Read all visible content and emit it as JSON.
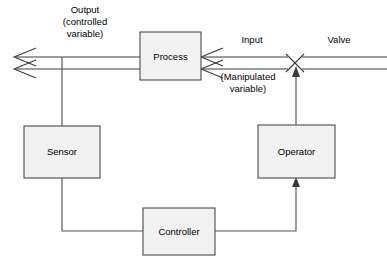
{
  "diagram": {
    "type": "block-flow-diagram",
    "colors": {
      "box_fill": "#f1f1f1",
      "box_border": "#4a4a4a",
      "line": "#3c3c3c",
      "signal_line": "#5a5a5a",
      "background": "#ffffff",
      "text": "#000000"
    },
    "blocks": [
      {
        "id": "process",
        "label": "Process",
        "x": 140,
        "y": 32,
        "w": 61,
        "h": 48
      },
      {
        "id": "sensor",
        "label": "Sensor",
        "x": 24,
        "y": 126,
        "w": 76,
        "h": 52
      },
      {
        "id": "operator",
        "label": "Operator",
        "x": 258,
        "y": 125,
        "w": 77,
        "h": 53
      },
      {
        "id": "controller",
        "label": "Controller",
        "x": 143,
        "y": 208,
        "w": 72,
        "h": 47
      }
    ],
    "annotations": [
      {
        "id": "output-label",
        "lines": [
          "Output",
          "(controlled",
          "variable)"
        ],
        "x": 85,
        "y": 13
      },
      {
        "id": "input-label",
        "lines": [
          "Input"
        ],
        "x": 252,
        "y": 43
      },
      {
        "id": "manipulated-label",
        "lines": [
          "(Manipulated",
          "variable)"
        ],
        "x": 248,
        "y": 80
      },
      {
        "id": "valve-label",
        "lines": [
          "Valve"
        ],
        "x": 339,
        "y": 43
      }
    ],
    "valve": {
      "id": "valve-symbol",
      "shape": "bowtie-cross",
      "center_x": 295,
      "center_y": 63
    },
    "flows": [
      {
        "id": "output-flow",
        "from": "process",
        "to": "output-arrow",
        "style": "double-line-pipe"
      },
      {
        "id": "input-flow",
        "from": "valve",
        "to": "process",
        "style": "double-line-pipe"
      },
      {
        "id": "supply-flow",
        "from": "right-edge",
        "to": "valve",
        "style": "double-line-pipe"
      },
      {
        "id": "sensor-tap",
        "from": "output-flow",
        "to": "sensor",
        "style": "signal-line"
      },
      {
        "id": "sensor-to-ctrl",
        "from": "sensor",
        "to": "controller",
        "style": "signal-line"
      },
      {
        "id": "ctrl-to-operator",
        "from": "controller",
        "to": "operator",
        "style": "signal-line-arrow"
      },
      {
        "id": "operator-to-valve",
        "from": "operator",
        "to": "valve",
        "style": "signal-line-arrow"
      }
    ]
  }
}
